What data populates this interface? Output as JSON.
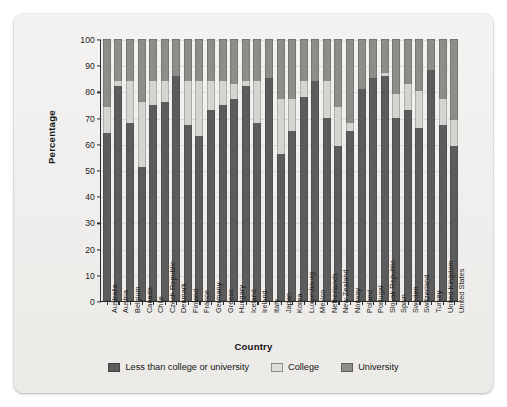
{
  "figure": {
    "background_color": "#f1f0ee",
    "plot_background_color": "#f3f2f0"
  },
  "chart_data": {
    "type": "bar",
    "subtype": "stacked-100-percent",
    "title": "",
    "xlabel": "Country",
    "ylabel": "Percentage",
    "ylim": [
      0,
      100
    ],
    "yticks": [
      0,
      10,
      20,
      30,
      40,
      50,
      60,
      70,
      80,
      90,
      100
    ],
    "grid": true,
    "legend_position": "bottom",
    "categories": [
      "Australia",
      "Austria",
      "Belgium",
      "Canada",
      "Chile",
      "Czech Republic",
      "Denmark",
      "Finland",
      "France",
      "Germany",
      "Greece",
      "Hungary",
      "Iceland",
      "Ireland",
      "Italy",
      "Japan",
      "Korea",
      "Luxembourg",
      "Mexico",
      "Netherlands",
      "New Zealand",
      "Norway",
      "Poland",
      "Portugal",
      "Slovak Republic",
      "Spain",
      "Sweden",
      "Switzerland",
      "Turkey",
      "United Kingdom",
      "United States"
    ],
    "series": [
      {
        "name": "Less than college or university",
        "color": "#5c5c5c",
        "values": [
          64,
          82,
          68,
          51,
          75,
          76,
          86,
          67,
          63,
          73,
          75,
          77,
          82,
          68,
          85,
          56,
          65,
          78,
          84,
          70,
          59,
          65,
          81,
          85,
          86,
          70,
          73,
          66,
          88,
          67,
          59
        ]
      },
      {
        "name": "College",
        "color": "#d6d4d0",
        "values": [
          10,
          2,
          16,
          25,
          9,
          8,
          0,
          17,
          21,
          11,
          9,
          6,
          2,
          16,
          0,
          21,
          12,
          6,
          0,
          14,
          15,
          3,
          0,
          0,
          1,
          9,
          10,
          14,
          0,
          10,
          10
        ]
      },
      {
        "name": "University",
        "color": "#8e8d89",
        "values": [
          26,
          16,
          16,
          24,
          16,
          16,
          14,
          16,
          16,
          16,
          16,
          17,
          16,
          16,
          15,
          23,
          23,
          16,
          16,
          16,
          26,
          32,
          19,
          15,
          13,
          21,
          17,
          20,
          12,
          23,
          31
        ]
      }
    ]
  },
  "axes": {
    "y_title": "Percentage",
    "x_title": "Country",
    "y_tick_labels": [
      "0",
      "10",
      "20",
      "30",
      "40",
      "50",
      "60",
      "70",
      "80",
      "90",
      "100"
    ]
  },
  "legend": {
    "items": [
      {
        "label": "Less than college or university",
        "color": "#5c5c5c"
      },
      {
        "label": "College",
        "color": "#dedcd8"
      },
      {
        "label": "University",
        "color": "#8e8d89"
      }
    ]
  }
}
